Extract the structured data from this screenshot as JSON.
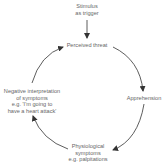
{
  "diagram": {
    "type": "cycle",
    "nodes": [
      {
        "id": "stimulus",
        "lines": [
          "Stimulus",
          "as trigger"
        ]
      },
      {
        "id": "perceived-threat",
        "lines": [
          "Perceived threat"
        ]
      },
      {
        "id": "apprehension",
        "lines": [
          "Apprehension"
        ]
      },
      {
        "id": "physiological-symptoms",
        "lines": [
          "Physiological",
          "symptoms",
          "e.g. palpitations"
        ]
      },
      {
        "id": "negative-interpretation",
        "lines": [
          "Negative interpretation",
          "of symptoms",
          "e.g. 'I'm going to",
          "have a heart attack'"
        ]
      }
    ],
    "edges": [
      {
        "from": "stimulus",
        "to": "perceived-threat"
      },
      {
        "from": "perceived-threat",
        "to": "apprehension"
      },
      {
        "from": "apprehension",
        "to": "physiological-symptoms"
      },
      {
        "from": "physiological-symptoms",
        "to": "negative-interpretation"
      },
      {
        "from": "negative-interpretation",
        "to": "perceived-threat"
      }
    ],
    "colors": {
      "text": "#666666",
      "arrow": "#333333",
      "background": "#ffffff"
    }
  }
}
